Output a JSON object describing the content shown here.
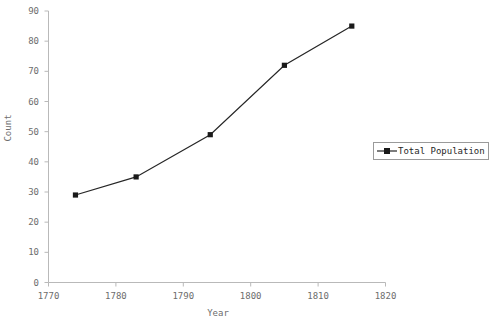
{
  "chart_data": {
    "type": "line",
    "title": "",
    "xlabel": "Year",
    "ylabel": "Count",
    "xlim": [
      1770,
      1820
    ],
    "ylim": [
      0,
      90
    ],
    "grid": false,
    "legend_position": "right",
    "x": [
      1774,
      1783,
      1794,
      1805,
      1815
    ],
    "series": [
      {
        "name": "Total Population",
        "values": [
          29,
          35,
          49,
          72,
          85
        ],
        "color": "#262626",
        "marker": "square"
      }
    ],
    "xticks": [
      {
        "value": 1770,
        "label": "1770"
      },
      {
        "value": 1780,
        "label": "1780"
      },
      {
        "value": 1790,
        "label": "1790"
      },
      {
        "value": 1800,
        "label": "1800"
      },
      {
        "value": 1810,
        "label": "1810"
      },
      {
        "value": 1820,
        "label": "1820"
      }
    ],
    "yticks": [
      {
        "value": 0,
        "label": "0"
      },
      {
        "value": 10,
        "label": "10"
      },
      {
        "value": 20,
        "label": "20"
      },
      {
        "value": 30,
        "label": "30"
      },
      {
        "value": 40,
        "label": "40"
      },
      {
        "value": 50,
        "label": "50"
      },
      {
        "value": 60,
        "label": "60"
      },
      {
        "value": 70,
        "label": "70"
      },
      {
        "value": 80,
        "label": "80"
      },
      {
        "value": 90,
        "label": "90"
      }
    ]
  },
  "legend": {
    "entries": [
      {
        "label": "Total Population"
      }
    ]
  },
  "colors": {
    "line": "#262626",
    "marker": "#1a1a1a",
    "axis": "#b9b9b9",
    "tick_text": "#6d6d6d",
    "legend_border": "#9a9a9a",
    "background": "#ffffff"
  }
}
